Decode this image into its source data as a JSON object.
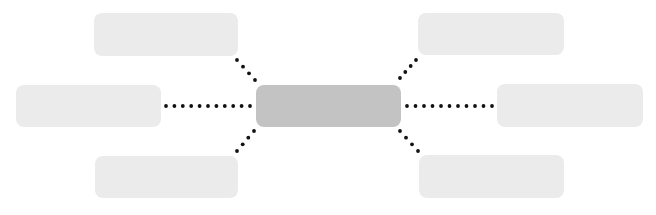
{
  "diagram": {
    "type": "hub-and-spoke",
    "colors": {
      "background": "#ffffff",
      "center_fill": "#c3c3c3",
      "outer_fill": "#ebebeb",
      "connector_dot": "#111111"
    },
    "center": {
      "id": "center",
      "label": "",
      "x": 256,
      "y": 85,
      "w": 145,
      "h": 42
    },
    "nodes": [
      {
        "id": "top-left",
        "label": "",
        "x": 94,
        "y": 13,
        "w": 144,
        "h": 43
      },
      {
        "id": "middle-left",
        "label": "",
        "x": 16,
        "y": 85,
        "w": 145,
        "h": 42
      },
      {
        "id": "bottom-left",
        "label": "",
        "x": 95,
        "y": 156,
        "w": 143,
        "h": 42
      },
      {
        "id": "top-right",
        "label": "",
        "x": 418,
        "y": 13,
        "w": 146,
        "h": 42
      },
      {
        "id": "middle-right",
        "label": "",
        "x": 497,
        "y": 84,
        "w": 146,
        "h": 43
      },
      {
        "id": "bottom-right",
        "label": "",
        "x": 419,
        "y": 155,
        "w": 145,
        "h": 43
      }
    ],
    "connectors": [
      {
        "id": "to-top-left",
        "style": "dotted",
        "x1": 255,
        "y1": 80,
        "x2": 237,
        "y2": 60,
        "dots": 4
      },
      {
        "id": "to-middle-left",
        "style": "dotted",
        "x1": 250,
        "y1": 106,
        "x2": 166,
        "y2": 106,
        "dots": 11
      },
      {
        "id": "to-bottom-left",
        "style": "dotted",
        "x1": 254,
        "y1": 131,
        "x2": 237,
        "y2": 151,
        "dots": 4
      },
      {
        "id": "to-top-right",
        "style": "dotted",
        "x1": 400,
        "y1": 78,
        "x2": 416,
        "y2": 60,
        "dots": 4
      },
      {
        "id": "to-middle-right",
        "style": "dotted",
        "x1": 407,
        "y1": 106,
        "x2": 492,
        "y2": 106,
        "dots": 11
      },
      {
        "id": "to-bottom-right",
        "style": "dotted",
        "x1": 400,
        "y1": 131,
        "x2": 418,
        "y2": 151,
        "dots": 4
      }
    ]
  }
}
